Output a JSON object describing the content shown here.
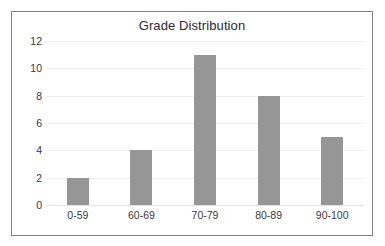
{
  "chart_data": {
    "type": "bar",
    "title": "Grade Distribution",
    "categories": [
      "0-59",
      "60-69",
      "70-79",
      "80-89",
      "90-100"
    ],
    "values": [
      2,
      4,
      11,
      8,
      5
    ],
    "xlabel": "",
    "ylabel": "",
    "ylim": [
      0,
      12
    ],
    "ytick_step": 2,
    "yticks": [
      0,
      2,
      4,
      6,
      8,
      10,
      12
    ],
    "ytick_labels": [
      "0",
      "2",
      "4",
      "6",
      "8",
      "10",
      "12"
    ],
    "grid": true,
    "grid_axis": "y",
    "legend": false,
    "legend_position": "none",
    "bar_color": "#969696",
    "gridline_color": "#efefef",
    "border_color": "#808080",
    "background_color": "#ffffff",
    "text_color": "#3a3a3a",
    "title_color": "#2b2b2b"
  }
}
